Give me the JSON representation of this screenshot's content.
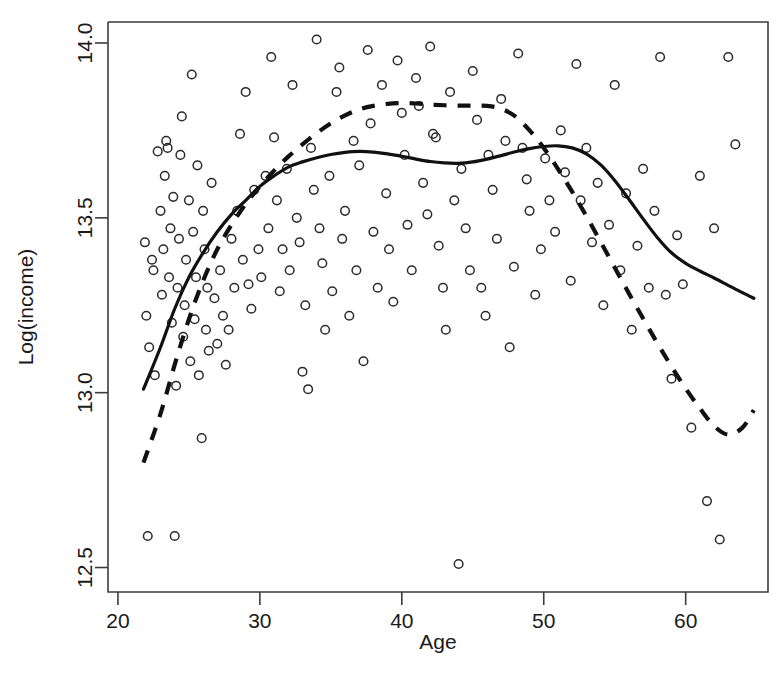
{
  "chart_data": {
    "type": "scatter",
    "title": "",
    "xlabel": "Age",
    "ylabel": "Log(income)",
    "xlim": [
      19.3,
      65.8
    ],
    "ylim": [
      12.43,
      14.06
    ],
    "grid": false,
    "legend_position": "none",
    "xticks": [
      20,
      30,
      40,
      50,
      60
    ],
    "xtick_labels": [
      "20",
      "30",
      "40",
      "50",
      "60"
    ],
    "yticks": [
      12.5,
      13.0,
      13.5,
      14.0
    ],
    "ytick_labels": [
      "12.5",
      "13.0",
      "13.5",
      "14.0"
    ],
    "point_marker": "open-circle",
    "series": [
      {
        "name": "observations",
        "type": "scatter",
        "points": [
          [
            21.9,
            13.43
          ],
          [
            22.0,
            13.22
          ],
          [
            22.1,
            12.59
          ],
          [
            22.2,
            13.13
          ],
          [
            22.4,
            13.38
          ],
          [
            22.5,
            13.35
          ],
          [
            22.6,
            13.05
          ],
          [
            22.8,
            13.69
          ],
          [
            23.0,
            13.52
          ],
          [
            23.1,
            13.28
          ],
          [
            23.2,
            13.41
          ],
          [
            23.3,
            13.62
          ],
          [
            23.4,
            13.72
          ],
          [
            23.5,
            13.7
          ],
          [
            23.6,
            13.33
          ],
          [
            23.7,
            13.47
          ],
          [
            23.8,
            13.2
          ],
          [
            23.9,
            13.56
          ],
          [
            24.0,
            12.59
          ],
          [
            24.1,
            13.02
          ],
          [
            24.2,
            13.3
          ],
          [
            24.3,
            13.44
          ],
          [
            24.4,
            13.68
          ],
          [
            24.5,
            13.79
          ],
          [
            24.6,
            13.16
          ],
          [
            24.7,
            13.25
          ],
          [
            24.8,
            13.38
          ],
          [
            25.0,
            13.55
          ],
          [
            25.1,
            13.09
          ],
          [
            25.2,
            13.91
          ],
          [
            25.3,
            13.46
          ],
          [
            25.4,
            13.21
          ],
          [
            25.5,
            13.33
          ],
          [
            25.6,
            13.65
          ],
          [
            25.7,
            13.05
          ],
          [
            25.9,
            12.87
          ],
          [
            26.0,
            13.52
          ],
          [
            26.1,
            13.41
          ],
          [
            26.2,
            13.18
          ],
          [
            26.3,
            13.3
          ],
          [
            26.4,
            13.12
          ],
          [
            26.6,
            13.6
          ],
          [
            26.8,
            13.27
          ],
          [
            27.0,
            13.14
          ],
          [
            27.2,
            13.35
          ],
          [
            27.4,
            13.22
          ],
          [
            27.6,
            13.08
          ],
          [
            27.8,
            13.18
          ],
          [
            28.0,
            13.44
          ],
          [
            28.2,
            13.3
          ],
          [
            28.4,
            13.52
          ],
          [
            28.6,
            13.74
          ],
          [
            28.8,
            13.38
          ],
          [
            29.0,
            13.86
          ],
          [
            29.2,
            13.31
          ],
          [
            29.4,
            13.24
          ],
          [
            29.6,
            13.58
          ],
          [
            29.9,
            13.41
          ],
          [
            30.1,
            13.33
          ],
          [
            30.4,
            13.62
          ],
          [
            30.6,
            13.47
          ],
          [
            30.8,
            13.96
          ],
          [
            31.0,
            13.73
          ],
          [
            31.2,
            13.55
          ],
          [
            31.4,
            13.29
          ],
          [
            31.6,
            13.41
          ],
          [
            31.9,
            13.64
          ],
          [
            32.1,
            13.35
          ],
          [
            32.3,
            13.88
          ],
          [
            32.6,
            13.5
          ],
          [
            32.8,
            13.43
          ],
          [
            33.0,
            13.06
          ],
          [
            33.2,
            13.25
          ],
          [
            33.4,
            13.01
          ],
          [
            33.6,
            13.7
          ],
          [
            33.8,
            13.58
          ],
          [
            34.0,
            14.01
          ],
          [
            34.2,
            13.47
          ],
          [
            34.4,
            13.37
          ],
          [
            34.6,
            13.18
          ],
          [
            34.9,
            13.62
          ],
          [
            35.1,
            13.29
          ],
          [
            35.4,
            13.86
          ],
          [
            35.6,
            13.93
          ],
          [
            35.8,
            13.44
          ],
          [
            36.0,
            13.52
          ],
          [
            36.3,
            13.22
          ],
          [
            36.6,
            13.72
          ],
          [
            36.8,
            13.35
          ],
          [
            37.0,
            13.65
          ],
          [
            37.3,
            13.09
          ],
          [
            37.6,
            13.98
          ],
          [
            37.8,
            13.77
          ],
          [
            38.0,
            13.46
          ],
          [
            38.3,
            13.3
          ],
          [
            38.6,
            13.88
          ],
          [
            38.9,
            13.57
          ],
          [
            39.1,
            13.41
          ],
          [
            39.4,
            13.26
          ],
          [
            39.7,
            13.95
          ],
          [
            40.0,
            13.8
          ],
          [
            40.2,
            13.68
          ],
          [
            40.4,
            13.48
          ],
          [
            40.7,
            13.35
          ],
          [
            41.0,
            13.9
          ],
          [
            41.2,
            13.82
          ],
          [
            41.5,
            13.6
          ],
          [
            41.8,
            13.51
          ],
          [
            42.0,
            13.99
          ],
          [
            42.2,
            13.74
          ],
          [
            42.4,
            13.73
          ],
          [
            42.6,
            13.42
          ],
          [
            42.9,
            13.3
          ],
          [
            43.1,
            13.18
          ],
          [
            43.4,
            13.86
          ],
          [
            43.7,
            13.55
          ],
          [
            44.0,
            12.51
          ],
          [
            44.2,
            13.64
          ],
          [
            44.5,
            13.47
          ],
          [
            44.8,
            13.35
          ],
          [
            45.0,
            13.92
          ],
          [
            45.3,
            13.78
          ],
          [
            45.6,
            13.3
          ],
          [
            45.9,
            13.22
          ],
          [
            46.1,
            13.68
          ],
          [
            46.4,
            13.58
          ],
          [
            46.7,
            13.44
          ],
          [
            47.0,
            13.84
          ],
          [
            47.3,
            13.72
          ],
          [
            47.6,
            13.13
          ],
          [
            47.9,
            13.36
          ],
          [
            48.2,
            13.97
          ],
          [
            48.5,
            13.7
          ],
          [
            48.8,
            13.61
          ],
          [
            49.0,
            13.52
          ],
          [
            49.4,
            13.28
          ],
          [
            49.8,
            13.41
          ],
          [
            50.1,
            13.67
          ],
          [
            50.4,
            13.55
          ],
          [
            50.8,
            13.46
          ],
          [
            51.2,
            13.75
          ],
          [
            51.5,
            13.63
          ],
          [
            51.9,
            13.32
          ],
          [
            52.3,
            13.94
          ],
          [
            52.6,
            13.55
          ],
          [
            53.0,
            13.7
          ],
          [
            53.4,
            13.43
          ],
          [
            53.8,
            13.6
          ],
          [
            54.2,
            13.25
          ],
          [
            54.6,
            13.48
          ],
          [
            55.0,
            13.88
          ],
          [
            55.4,
            13.35
          ],
          [
            55.8,
            13.57
          ],
          [
            56.2,
            13.18
          ],
          [
            56.6,
            13.42
          ],
          [
            57.0,
            13.64
          ],
          [
            57.4,
            13.3
          ],
          [
            57.8,
            13.52
          ],
          [
            58.2,
            13.96
          ],
          [
            58.6,
            13.28
          ],
          [
            59.0,
            13.04
          ],
          [
            59.4,
            13.45
          ],
          [
            59.8,
            13.31
          ],
          [
            60.4,
            12.9
          ],
          [
            61.0,
            13.62
          ],
          [
            61.5,
            12.69
          ],
          [
            62.0,
            13.47
          ],
          [
            62.4,
            12.58
          ],
          [
            63.0,
            13.96
          ],
          [
            63.5,
            13.71
          ]
        ]
      },
      {
        "name": "solid-smoother",
        "type": "line",
        "style": "solid",
        "points": [
          [
            21.8,
            13.01
          ],
          [
            23.0,
            13.13
          ],
          [
            24.0,
            13.24
          ],
          [
            25.0,
            13.33
          ],
          [
            26.0,
            13.4
          ],
          [
            27.0,
            13.46
          ],
          [
            28.0,
            13.51
          ],
          [
            29.0,
            13.55
          ],
          [
            30.0,
            13.59
          ],
          [
            31.0,
            13.62
          ],
          [
            32.0,
            13.645
          ],
          [
            33.0,
            13.66
          ],
          [
            34.0,
            13.672
          ],
          [
            35.0,
            13.681
          ],
          [
            36.0,
            13.687
          ],
          [
            37.0,
            13.69
          ],
          [
            38.0,
            13.688
          ],
          [
            39.0,
            13.683
          ],
          [
            40.0,
            13.676
          ],
          [
            41.0,
            13.668
          ],
          [
            42.0,
            13.661
          ],
          [
            43.0,
            13.657
          ],
          [
            44.0,
            13.656
          ],
          [
            45.0,
            13.66
          ],
          [
            46.0,
            13.668
          ],
          [
            47.0,
            13.678
          ],
          [
            48.0,
            13.689
          ],
          [
            49.0,
            13.698
          ],
          [
            50.0,
            13.704
          ],
          [
            51.0,
            13.706
          ],
          [
            52.0,
            13.7
          ],
          [
            53.0,
            13.683
          ],
          [
            54.0,
            13.652
          ],
          [
            55.0,
            13.607
          ],
          [
            56.0,
            13.553
          ],
          [
            57.0,
            13.497
          ],
          [
            58.0,
            13.444
          ],
          [
            59.0,
            13.4
          ],
          [
            60.0,
            13.37
          ],
          [
            61.0,
            13.348
          ],
          [
            62.0,
            13.328
          ],
          [
            63.0,
            13.307
          ],
          [
            64.0,
            13.286
          ],
          [
            64.8,
            13.27
          ]
        ]
      },
      {
        "name": "dashed-smoother",
        "type": "line",
        "style": "dashed",
        "points": [
          [
            21.8,
            12.8
          ],
          [
            23.0,
            12.94
          ],
          [
            24.0,
            13.08
          ],
          [
            25.0,
            13.21
          ],
          [
            26.0,
            13.32
          ],
          [
            27.0,
            13.41
          ],
          [
            28.0,
            13.48
          ],
          [
            29.0,
            13.54
          ],
          [
            30.0,
            13.59
          ],
          [
            31.0,
            13.635
          ],
          [
            32.0,
            13.675
          ],
          [
            33.0,
            13.71
          ],
          [
            34.0,
            13.742
          ],
          [
            35.0,
            13.77
          ],
          [
            36.0,
            13.793
          ],
          [
            37.0,
            13.81
          ],
          [
            38.0,
            13.82
          ],
          [
            39.0,
            13.826
          ],
          [
            40.0,
            13.828
          ],
          [
            41.0,
            13.827
          ],
          [
            42.0,
            13.824
          ],
          [
            43.0,
            13.822
          ],
          [
            44.0,
            13.821
          ],
          [
            45.0,
            13.821
          ],
          [
            46.0,
            13.82
          ],
          [
            47.0,
            13.812
          ],
          [
            48.0,
            13.79
          ],
          [
            49.0,
            13.75
          ],
          [
            50.0,
            13.7
          ],
          [
            51.0,
            13.64
          ],
          [
            52.0,
            13.575
          ],
          [
            53.0,
            13.505
          ],
          [
            54.0,
            13.432
          ],
          [
            55.0,
            13.358
          ],
          [
            56.0,
            13.284
          ],
          [
            57.0,
            13.212
          ],
          [
            58.0,
            13.142
          ],
          [
            59.0,
            13.075
          ],
          [
            60.0,
            13.012
          ],
          [
            61.0,
            12.955
          ],
          [
            62.0,
            12.905
          ],
          [
            63.0,
            12.88
          ],
          [
            64.0,
            12.9
          ],
          [
            64.8,
            12.95
          ]
        ]
      }
    ]
  },
  "axes": {
    "x_title": "Age",
    "y_title": "Log(income)"
  },
  "colors": {
    "axis": "#3c3c3c",
    "point": "#2b2b2b",
    "curve": "#111111",
    "background": "#ffffff"
  }
}
